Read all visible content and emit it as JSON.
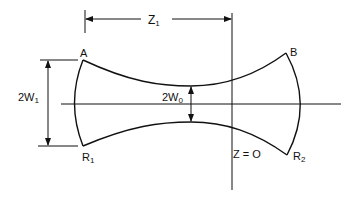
{
  "diagram": {
    "colors": {
      "ink": "#111111",
      "background": "#ffffff"
    },
    "labels": {
      "point_a": "A",
      "point_b": "B",
      "radius_1": {
        "main": "R",
        "sub": "1"
      },
      "radius_2": {
        "main": "R",
        "sub": "2"
      },
      "width_1": {
        "main": "2W",
        "sub": "1"
      },
      "waist": {
        "main": "2W",
        "sub": "0"
      },
      "distance": {
        "main": "Z",
        "sub": "1"
      },
      "origin": "Z = O"
    },
    "geometry": {
      "axis_y": 104,
      "origin_x": 232,
      "waist_x": 191,
      "waist_half_width_px": 18,
      "point_a": [
        83,
        60
      ],
      "point_r1": [
        83,
        146
      ],
      "point_b": [
        286,
        53
      ],
      "point_r2": [
        287,
        155
      ]
    }
  }
}
